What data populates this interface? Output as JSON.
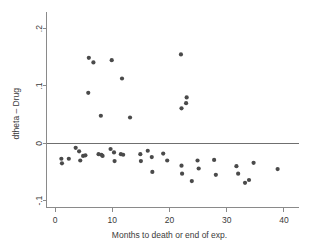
{
  "chart_data": {
    "type": "scatter",
    "title": "",
    "xlabel": "Months to death or end of exp.",
    "ylabel": "dtheta – Drug",
    "xlim": [
      -1.5,
      41.5
    ],
    "ylim": [
      -0.112,
      0.215
    ],
    "xticks": [
      0,
      10,
      20,
      30,
      40
    ],
    "xticklabels": [
      "0",
      "10",
      "20",
      "30",
      "40"
    ],
    "yticks": [
      -0.1,
      0,
      0.1,
      0.2
    ],
    "yticklabels": [
      "-.1",
      "0",
      ".1",
      ".2"
    ],
    "grid": false,
    "legend": null,
    "reference_lines": [
      {
        "orientation": "horizontal",
        "value": 0
      }
    ],
    "marker": {
      "shape": "circle",
      "radius_px": 2.1,
      "color": "#4a4a4a"
    },
    "series": [
      {
        "name": "dtheta Drug",
        "color": "#4a4a4a",
        "points": [
          [
            5.9,
            0.149
          ],
          [
            6.7,
            0.141
          ],
          [
            9.9,
            0.145
          ],
          [
            11.7,
            0.113
          ],
          [
            5.8,
            0.088
          ],
          [
            22.0,
            0.155
          ],
          [
            23.0,
            0.08
          ],
          [
            22.9,
            0.07
          ],
          [
            22.1,
            0.061
          ],
          [
            8.0,
            0.048
          ],
          [
            13.1,
            0.045
          ],
          [
            1.1,
            -0.027
          ],
          [
            1.2,
            -0.035
          ],
          [
            2.4,
            -0.027
          ],
          [
            3.6,
            -0.008
          ],
          [
            4.2,
            -0.014
          ],
          [
            4.4,
            -0.03
          ],
          [
            4.9,
            -0.022
          ],
          [
            5.3,
            -0.021
          ],
          [
            7.6,
            -0.019
          ],
          [
            8.1,
            -0.02
          ],
          [
            8.3,
            -0.022
          ],
          [
            9.7,
            -0.01
          ],
          [
            10.3,
            -0.016
          ],
          [
            10.4,
            -0.031
          ],
          [
            11.5,
            -0.019
          ],
          [
            11.9,
            -0.02
          ],
          [
            14.9,
            -0.019
          ],
          [
            15.0,
            -0.031
          ],
          [
            16.2,
            -0.013
          ],
          [
            16.9,
            -0.024
          ],
          [
            17.0,
            -0.05
          ],
          [
            18.9,
            -0.018
          ],
          [
            19.6,
            -0.03
          ],
          [
            22.1,
            -0.039
          ],
          [
            22.2,
            -0.053
          ],
          [
            23.9,
            -0.066
          ],
          [
            24.9,
            -0.03
          ],
          [
            25.1,
            -0.044
          ],
          [
            27.8,
            -0.029
          ],
          [
            28.1,
            -0.055
          ],
          [
            31.7,
            -0.04
          ],
          [
            32.0,
            -0.053
          ],
          [
            33.2,
            -0.069
          ],
          [
            33.9,
            -0.064
          ],
          [
            34.7,
            -0.034
          ],
          [
            38.9,
            -0.045
          ]
        ]
      }
    ]
  }
}
